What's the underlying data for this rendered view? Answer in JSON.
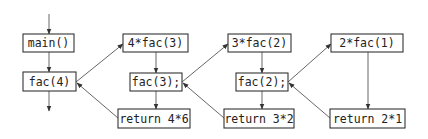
{
  "diagram": {
    "nodes": [
      {
        "id": "main",
        "label": "main()",
        "x": 23,
        "y": 34,
        "w": 51,
        "h": 18
      },
      {
        "id": "fac4",
        "label": "fac(4)",
        "x": 23,
        "y": 72,
        "w": 53,
        "h": 19
      },
      {
        "id": "call3",
        "label": "4*fac(3)",
        "x": 123,
        "y": 34,
        "w": 65,
        "h": 18
      },
      {
        "id": "fac3",
        "label": "fac(3);",
        "x": 130,
        "y": 73,
        "w": 52,
        "h": 18
      },
      {
        "id": "ret46",
        "label": "return 4*6",
        "x": 118,
        "y": 109,
        "w": 72,
        "h": 19
      },
      {
        "id": "call2",
        "label": "3*fac(2)",
        "x": 228,
        "y": 34,
        "w": 63,
        "h": 18
      },
      {
        "id": "fac2",
        "label": "fac(2);",
        "x": 236,
        "y": 73,
        "w": 52,
        "h": 18
      },
      {
        "id": "ret32",
        "label": "return 3*2",
        "x": 224,
        "y": 109,
        "w": 70,
        "h": 19
      },
      {
        "id": "call1",
        "label": "2*fac(1)",
        "x": 331,
        "y": 34,
        "w": 72,
        "h": 18
      },
      {
        "id": "ret21",
        "label": "return 2*1",
        "x": 330,
        "y": 109,
        "w": 75,
        "h": 19
      }
    ],
    "edges": [
      {
        "from": "entry",
        "to": "main",
        "x1": 49,
        "y1": 14,
        "x2": 49,
        "y2": 34
      },
      {
        "from": "main",
        "to": "fac4",
        "x1": 49,
        "y1": 52,
        "x2": 49,
        "y2": 72
      },
      {
        "from": "fac4",
        "to": "exit",
        "x1": 49,
        "y1": 91,
        "x2": 49,
        "y2": 111
      },
      {
        "from": "fac4",
        "to": "call3",
        "x1": 76,
        "y1": 82,
        "x2": 123,
        "y2": 44
      },
      {
        "from": "call3",
        "to": "fac3",
        "x1": 156,
        "y1": 52,
        "x2": 156,
        "y2": 73
      },
      {
        "from": "fac3",
        "to": "ret46",
        "x1": 156,
        "y1": 91,
        "x2": 156,
        "y2": 109
      },
      {
        "from": "ret46",
        "to": "fac4",
        "x1": 118,
        "y1": 118,
        "x2": 77,
        "y2": 83
      },
      {
        "from": "fac3",
        "to": "call2",
        "x1": 182,
        "y1": 82,
        "x2": 228,
        "y2": 44
      },
      {
        "from": "call2",
        "to": "fac2",
        "x1": 262,
        "y1": 52,
        "x2": 262,
        "y2": 73
      },
      {
        "from": "fac2",
        "to": "ret32",
        "x1": 262,
        "y1": 91,
        "x2": 262,
        "y2": 109
      },
      {
        "from": "ret32",
        "to": "fac3",
        "x1": 224,
        "y1": 118,
        "x2": 183,
        "y2": 83
      },
      {
        "from": "fac2",
        "to": "call1",
        "x1": 288,
        "y1": 82,
        "x2": 331,
        "y2": 44
      },
      {
        "from": "call1",
        "to": "ret21",
        "x1": 368,
        "y1": 52,
        "x2": 368,
        "y2": 109
      },
      {
        "from": "ret21",
        "to": "fac2",
        "x1": 330,
        "y1": 118,
        "x2": 289,
        "y2": 83
      }
    ]
  }
}
